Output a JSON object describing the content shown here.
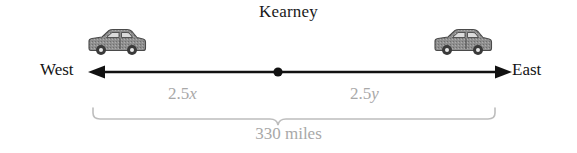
{
  "diagram": {
    "title": "Kearney",
    "type": "number-line-distance-diagram",
    "width": 577,
    "height": 153,
    "background": "#ffffff"
  },
  "axis": {
    "left_direction_label": "West",
    "right_direction_label": "East",
    "line_color": "#111111",
    "midpoint_marker": "filled-dot",
    "arrowheads": "both-ends"
  },
  "segments": [
    {
      "name": "west-segment",
      "label_prefix": "2.5",
      "label_variable": "x",
      "full_label": "2.5x",
      "color": "#a8a8a8"
    },
    {
      "name": "east-segment",
      "label_prefix": "2.5",
      "label_variable": "y",
      "full_label": "2.5y",
      "color": "#a8a8a8"
    }
  ],
  "total": {
    "label": "330 miles",
    "value": 330,
    "unit": "miles",
    "color": "#a8a8a8",
    "brace": "downward-center-point"
  },
  "vehicles": [
    {
      "name": "car-west",
      "icon": "car-icon",
      "facing": "right",
      "body_color": "#8d8d8d",
      "outline_color": "#4a4a4a"
    },
    {
      "name": "car-east",
      "icon": "car-icon",
      "facing": "right",
      "body_color": "#8d8d8d",
      "outline_color": "#4a4a4a"
    }
  ],
  "colors": {
    "ink": "#141414",
    "muted": "#a8a8a8",
    "car_body": "#8d8d8d",
    "car_outline": "#4a4a4a"
  }
}
